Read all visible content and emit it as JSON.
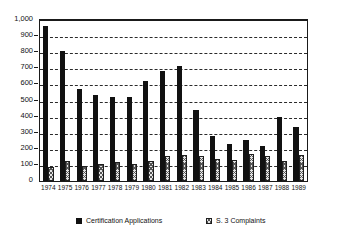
{
  "figure": {
    "title_partial": "",
    "background_color": "#ffffff",
    "frame_color": "#1a1a1a"
  },
  "legend": {
    "position": "bottom",
    "items": [
      {
        "label": "Certification Applications",
        "swatch": "black-square-icon",
        "color": "#111111"
      },
      {
        "label": "S. 3 Complaints",
        "swatch": "hatched-square-icon",
        "color": "#e4e4e4"
      }
    ]
  },
  "axes": {
    "y_ticks": [
      "1,000",
      "900",
      "800",
      "700",
      "600",
      "500",
      "400",
      "300",
      "200",
      "100",
      "0"
    ],
    "y_tick_values": [
      1000,
      900,
      800,
      700,
      600,
      500,
      400,
      300,
      200,
      100,
      0
    ]
  },
  "chart_data": {
    "type": "bar",
    "title": "",
    "subtitle": "",
    "xlabel": "",
    "ylabel": "",
    "ylim": [
      0,
      1000
    ],
    "ytick_step": 100,
    "grid": true,
    "grid_style": "dashed-horizontal",
    "legend_position": "bottom",
    "categories": [
      "1974",
      "1975",
      "1976",
      "1977",
      "1978",
      "1979",
      "1980",
      "1981",
      "1982",
      "1983",
      "1984",
      "1985",
      "1986",
      "1987",
      "1988",
      "1989"
    ],
    "series": [
      {
        "name": "Certification Applications",
        "color": "#111111",
        "values": [
          960,
          810,
          570,
          532,
          520,
          524,
          620,
          684,
          716,
          444,
          278,
          232,
          253,
          220,
          396,
          334
        ]
      },
      {
        "name": "S. 3 Complaints",
        "color": "#e4e4e4",
        "values": [
          86,
          124,
          96,
          104,
          116,
          108,
          124,
          155,
          164,
          153,
          138,
          128,
          169,
          158,
          122,
          160
        ]
      }
    ]
  }
}
